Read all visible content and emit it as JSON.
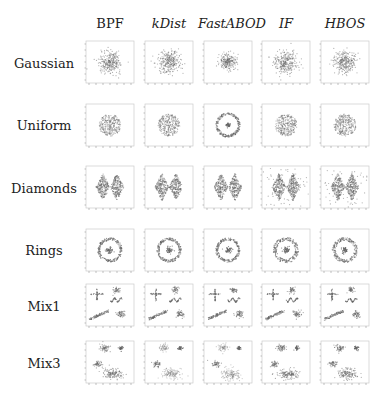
{
  "chart_data": {
    "type": "scatter",
    "title": "",
    "layout": "grid of scatter plot thumbnails (rows = datasets, columns = methods)",
    "columns": [
      {
        "label": "BPF",
        "italic": false
      },
      {
        "label": "kDist",
        "italic": true
      },
      {
        "label": "FastABOD",
        "italic": true
      },
      {
        "label": "IF",
        "italic": true
      },
      {
        "label": "HBOS",
        "italic": true
      }
    ],
    "rows": [
      {
        "label": "Gaussian",
        "shape": "gaussian"
      },
      {
        "label": "Uniform",
        "shape": "uniform"
      },
      {
        "label": "Diamonds",
        "shape": "diamonds"
      },
      {
        "label": "Rings",
        "shape": "rings"
      },
      {
        "label": "Mix1",
        "shape": "mix1"
      },
      {
        "label": "Mix3",
        "shape": "mix3"
      }
    ],
    "notes": {
      "FastABOD_Uniform": "outer ring with central dot instead of filled disc",
      "IF_HBOS_Diamonds": "scattered background noise points",
      "grid": false,
      "axis_ticks": "small unlabeled ticks on left and bottom"
    },
    "colors": {
      "points": "#666666",
      "frame": "#cccccc",
      "background": "#ffffff"
    }
  }
}
